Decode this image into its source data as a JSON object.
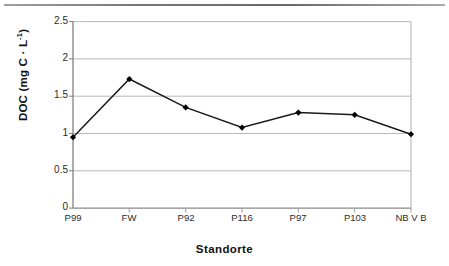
{
  "figure": {
    "background_color": "#ffffff",
    "border_color": "#808080",
    "scan_artifact": true
  },
  "chart_data": {
    "type": "line",
    "title": "",
    "subtitle": "",
    "xlabel": "Standorte",
    "ylabel": "DOC (mg C · L-1)",
    "ylabel_parts": {
      "main": "DOC (mg C · L",
      "exponent": "-1",
      "tail": ")"
    },
    "categories": [
      "P99",
      "FW",
      "P92",
      "P116",
      "P97",
      "P103",
      "NB V B"
    ],
    "values": [
      0.95,
      1.73,
      1.35,
      1.08,
      1.28,
      1.25,
      0.99
    ],
    "series": [
      {
        "name": "DOC",
        "values": [
          0.95,
          1.73,
          1.35,
          1.08,
          1.28,
          1.25,
          0.99
        ],
        "line_color": "#1a1a1a",
        "marker": "diamond",
        "marker_color": "#000000"
      }
    ],
    "ylim": [
      0,
      2.5
    ],
    "yticks": [
      0,
      0.5,
      1,
      1.5,
      2,
      2.5
    ],
    "ytick_labels": [
      "0",
      "0.5",
      "1",
      "1.5",
      "2",
      "2.5"
    ],
    "grid": {
      "horizontal": true,
      "vertical": false,
      "color": "#b9b9b9"
    },
    "legend": {
      "visible": false,
      "position": "none"
    },
    "axis": {
      "line_color": "#808080",
      "tick_color": "#808080"
    }
  }
}
